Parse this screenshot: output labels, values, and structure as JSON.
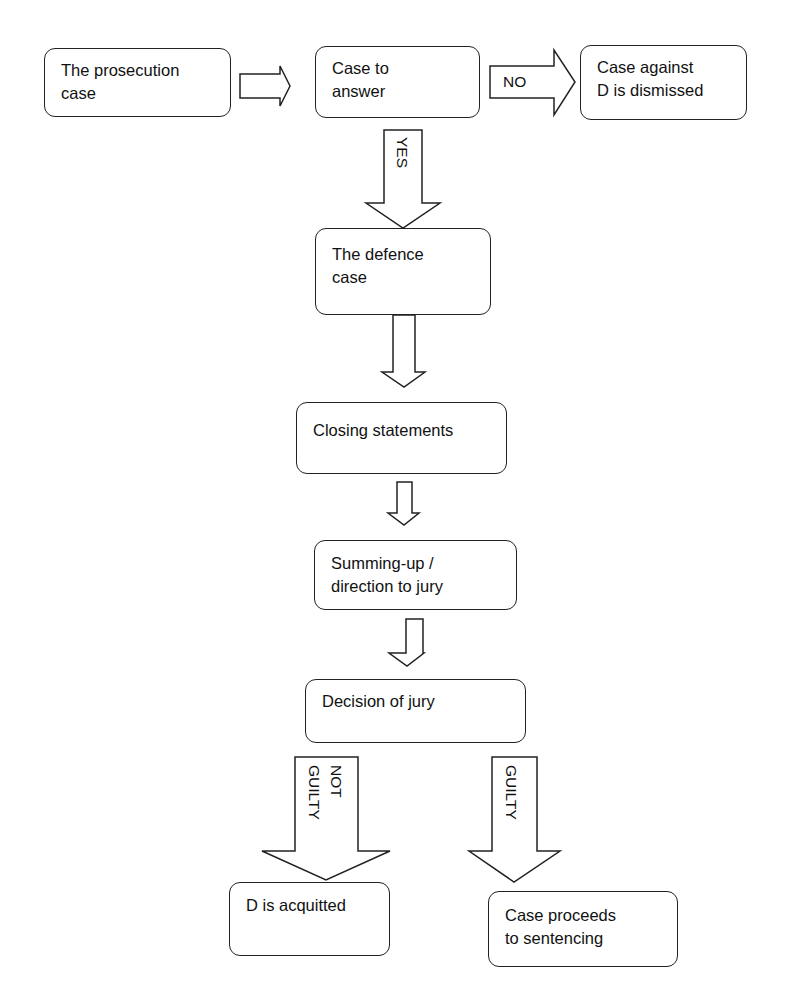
{
  "diagram": {
    "type": "flowchart",
    "nodes": {
      "prosecution": {
        "line1": "The prosecution",
        "line2": "case"
      },
      "case_to_answer": {
        "line1": "Case to",
        "line2": "answer"
      },
      "dismissed": {
        "line1": "Case against",
        "line2": "D is dismissed"
      },
      "defence": {
        "line1": "The defence",
        "line2": "case"
      },
      "closing": {
        "line1": "Closing statements"
      },
      "summing": {
        "line1": "Summing-up /",
        "line2": "direction to jury"
      },
      "decision": {
        "line1": "Decision of jury"
      },
      "acquitted": {
        "line1": "D is acquitted"
      },
      "sentencing": {
        "line1": "Case proceeds",
        "line2": "to sentencing"
      }
    },
    "edges": {
      "no": "NO",
      "yes": "YES",
      "not_guilty_1": "NOT",
      "not_guilty_2": "GUILTY",
      "guilty": "GUILTY"
    },
    "colors": {
      "stroke": "#222222",
      "fill": "#ffffff",
      "text": "#111111"
    }
  }
}
